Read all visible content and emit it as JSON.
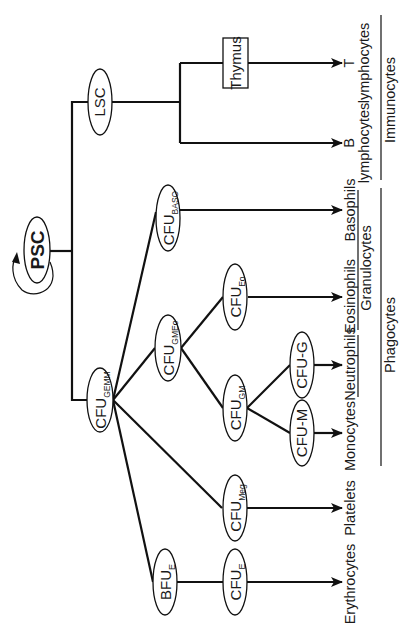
{
  "diagram": {
    "colors": {
      "line": "#111111",
      "background": "#ffffff",
      "text": "#1a1a1a"
    },
    "nodes": {
      "psc": {
        "label": "PSC"
      },
      "lsc": {
        "label": "LSC"
      },
      "thymus": {
        "label": "Thymus"
      },
      "cfu_gemm": {
        "base": "CFU",
        "sub": "GEMM"
      },
      "cfu_baso": {
        "base": "CFU",
        "sub": "BASO"
      },
      "cfu_gmeo": {
        "base": "CFU",
        "sub": "GMEo"
      },
      "cfu_eo": {
        "base": "CFU",
        "sub": "Eo"
      },
      "cfu_gm": {
        "base": "CFU",
        "sub": "GM"
      },
      "cfu_g": {
        "label": "CFU-G"
      },
      "cfu_m": {
        "label": "CFU-M"
      },
      "cfu_meg": {
        "base": "CFU",
        "sub": "Meg"
      },
      "bfu_e": {
        "base": "BFU",
        "sub": "E"
      },
      "cfu_e": {
        "base": "CFU",
        "sub": "E"
      }
    },
    "outputs": {
      "t_lymph_1": "T",
      "t_lymph_2": "lymphocytes",
      "b_lymph_1": "B",
      "b_lymph_2": "lymphocytes",
      "basophils": "Basophils",
      "eosinophils": "Eosinophils",
      "neutrophils": "Neutrophils",
      "monocytes": "Monocytes",
      "platelets": "Platelets",
      "erythrocytes": "Erythrocytes"
    },
    "groups": {
      "immunocytes": "Immunocytes",
      "granulocytes": "Granulocytes",
      "phagocytes": "Phagocytes"
    }
  }
}
